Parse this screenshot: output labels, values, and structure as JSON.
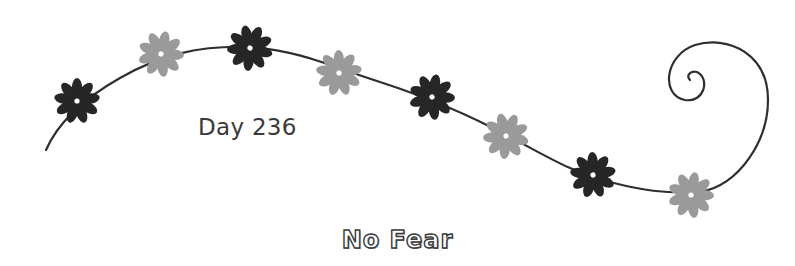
{
  "day_label": "Day 236",
  "title": "No Fear",
  "colors": {
    "dark_flower": "#262626",
    "light_flower": "#9a9a9a",
    "vine": "#2e2e2e",
    "text": "#3a3a3a"
  },
  "flowers": [
    {
      "x": 77,
      "y": 101,
      "tone": "dark"
    },
    {
      "x": 161,
      "y": 54,
      "tone": "light"
    },
    {
      "x": 250,
      "y": 48,
      "tone": "dark"
    },
    {
      "x": 339,
      "y": 73,
      "tone": "light"
    },
    {
      "x": 432,
      "y": 97,
      "tone": "dark"
    },
    {
      "x": 506,
      "y": 136,
      "tone": "light"
    },
    {
      "x": 593,
      "y": 175,
      "tone": "dark"
    },
    {
      "x": 691,
      "y": 195,
      "tone": "light"
    }
  ]
}
